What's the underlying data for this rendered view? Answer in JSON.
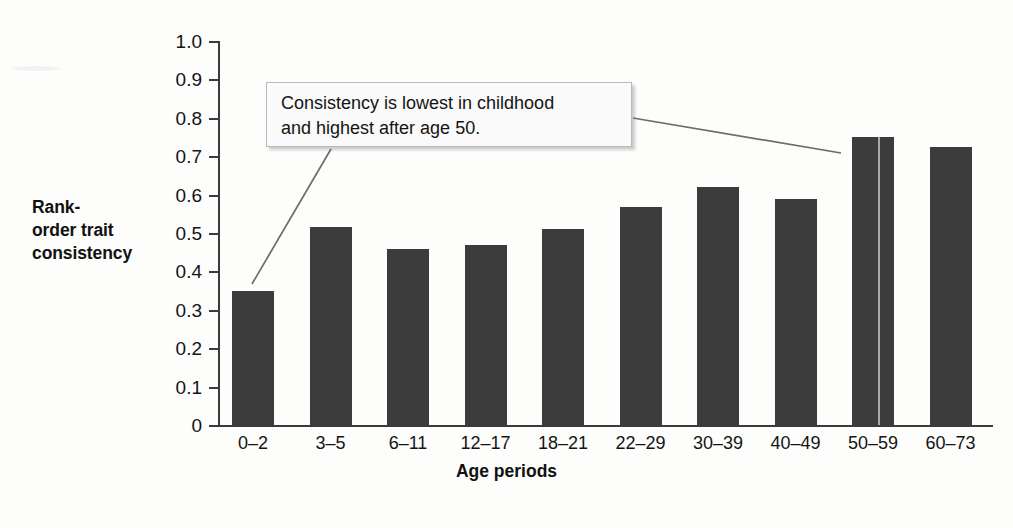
{
  "chart_data": {
    "type": "bar",
    "title": "",
    "xlabel": "Age periods",
    "ylabel": "Rank-order trait consistency",
    "categories": [
      "0–2",
      "3–5",
      "6–11",
      "12–17",
      "18–21",
      "22–29",
      "30–39",
      "40–49",
      "50–59",
      "60–73"
    ],
    "values": [
      0.35,
      0.515,
      0.458,
      0.47,
      0.51,
      0.567,
      0.62,
      0.588,
      0.75,
      0.723
    ],
    "ylim": [
      0,
      1.0
    ],
    "ytick_labels": [
      "0",
      "0.1",
      "0.2",
      "0.3",
      "0.4",
      "0.5",
      "0.6",
      "0.7",
      "0.8",
      "0.9",
      "1.0"
    ],
    "ytick_values": [
      0,
      0.1,
      0.2,
      0.3,
      0.4,
      0.5,
      0.6,
      0.7,
      0.8,
      0.9,
      1.0
    ],
    "grid": false,
    "legend": null,
    "bar_color": "#3c3c3c",
    "axis_color": "#3b3b3b",
    "annotations": [
      {
        "text": "Consistency is lowest in childhood and highest after age 50.",
        "line_1": "Consistency is lowest in childhood",
        "line_2": "and highest after age 50.",
        "points_to": [
          "0–2",
          "50–59"
        ]
      }
    ]
  },
  "axis": {
    "y_label_line1": "Rank-",
    "y_label_line2": "order trait",
    "y_label_line3": "consistency",
    "x_title": "Age periods"
  }
}
